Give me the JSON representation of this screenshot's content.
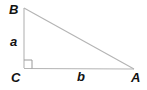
{
  "figure": {
    "kind": "right-triangle-diagram",
    "background_color": "#ffffff",
    "stroke_color": "#b4b4b4",
    "label_color": "#121212",
    "vertices": {
      "B": {
        "label": "B",
        "x": 24,
        "y": 8
      },
      "C": {
        "label": "C",
        "x": 24,
        "y": 68
      },
      "A": {
        "label": "A",
        "x": 134,
        "y": 69
      }
    },
    "sides": {
      "leg_vertical": {
        "label": "a",
        "from": "C",
        "to": "B"
      },
      "leg_horizontal": {
        "label": "b",
        "from": "C",
        "to": "A"
      },
      "hypotenuse": {
        "label": "",
        "from": "B",
        "to": "A"
      }
    },
    "right_angle": {
      "at_vertex": "C",
      "marker": "square",
      "size": 8
    }
  }
}
